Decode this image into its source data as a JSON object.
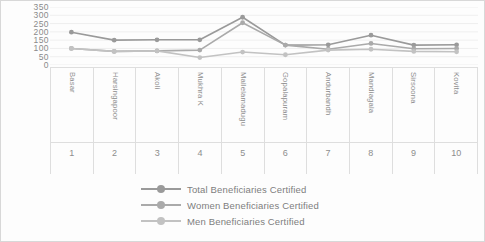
{
  "chart_data": {
    "type": "line",
    "title": "",
    "xlabel": "",
    "ylabel": "",
    "ylim": [
      0,
      350
    ],
    "yticks": [
      350,
      300,
      250,
      200,
      150,
      100,
      50,
      0
    ],
    "grid": true,
    "legend_position": "bottom",
    "categories": [
      "Basar",
      "Harsingapoor",
      "Akoli",
      "Mukhra K",
      "Mallelamadugu",
      "Gopalapuram",
      "Andurbandh",
      "Mandiagala",
      "Sirsoona",
      "Kovita"
    ],
    "category_numbers": [
      "1",
      "2",
      "3",
      "4",
      "5",
      "6",
      "7",
      "8",
      "9",
      "10"
    ],
    "series": [
      {
        "name": "Total Beneficiaries Certified",
        "color": "#9a9a9a",
        "values": [
          198,
          150,
          152,
          152,
          288,
          120,
          122,
          180,
          120,
          122
        ]
      },
      {
        "name": "Women Beneficiaries Certified",
        "color": "#aaaaaa",
        "values": [
          100,
          82,
          85,
          90,
          255,
          120,
          95,
          130,
          98,
          100
        ]
      },
      {
        "name": "Men Beneficiaries Certified",
        "color": "#c2c2c2",
        "values": [
          100,
          82,
          85,
          45,
          78,
          62,
          90,
          95,
          82,
          80
        ]
      }
    ]
  },
  "colors": {
    "grid": "#e8e8e8",
    "frame": "#dedede",
    "text": "#8d8d8d"
  }
}
